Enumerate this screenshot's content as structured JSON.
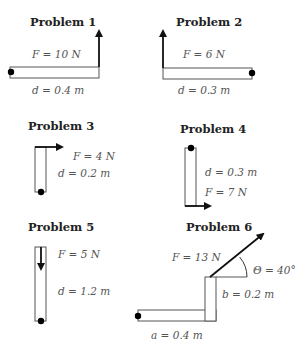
{
  "problems": [
    {
      "title": "Problem 1",
      "force": "F = 10 N",
      "distance": "d = 0.4 m"
    },
    {
      "title": "Problem 2",
      "force": "F = 6 N",
      "distance": "d = 0.3 m"
    },
    {
      "title": "Problem 3",
      "force": "F = 4 N",
      "distance": "d = 0.2 m"
    },
    {
      "title": "Problem 4",
      "force": "F = 7 N",
      "distance": "d = 0.3 m"
    },
    {
      "title": "Problem 5",
      "force": "F = 5 N",
      "distance": "d = 1.2 m"
    },
    {
      "title": "Problem 6",
      "force": "F = 13 N",
      "distance_a": "a = 0.4 m",
      "distance_b": "b = 0.2 m",
      "angle": "Θ = 40°"
    }
  ],
  "colors": {
    "bar_stroke": "#555555",
    "arrow": "#111111",
    "pivot": "#000000",
    "text": "#555555"
  }
}
